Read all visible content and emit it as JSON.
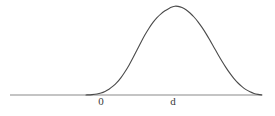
{
  "figure": {
    "kind": "bell-curve-plot",
    "background_color": "#ffffff",
    "curve_color": "#4a4a4a",
    "axis_color": "#8a8a8a",
    "label_color": "#3a3a3a"
  },
  "axis": {
    "name": "horizontal-axis",
    "x_start": 10,
    "x_end": 262,
    "y": 95,
    "stroke_width": 1.1
  },
  "labels": {
    "origin": "0",
    "mean": "d"
  },
  "chart_data": {
    "type": "line",
    "title": "",
    "subtitle": "",
    "xlabel": "",
    "ylabel": "",
    "grid": false,
    "legend": null,
    "annotations": [
      {
        "text": "0",
        "x": 101,
        "y": 106,
        "role": "x-tick-label"
      },
      {
        "text": "d",
        "x": 173,
        "y": 106,
        "role": "x-tick-label"
      }
    ],
    "axis_ranges": {
      "xlim": [
        10,
        262
      ],
      "ylim": [
        0,
        1
      ]
    },
    "series": [
      {
        "name": "gaussian-density",
        "shape": "bell",
        "peak_x": 175,
        "peak_y_px": 6,
        "baseline_y_px": 95,
        "left_foot_x": 99,
        "right_foot_x": 259,
        "points_px": [
          [
            86,
            95
          ],
          [
            92,
            94.6
          ],
          [
            97,
            94.0
          ],
          [
            101,
            93.0
          ],
          [
            105,
            91.4
          ],
          [
            109,
            89.2
          ],
          [
            113,
            86.2
          ],
          [
            117,
            82.4
          ],
          [
            121,
            77.6
          ],
          [
            125,
            71.8
          ],
          [
            129,
            65.2
          ],
          [
            133,
            57.8
          ],
          [
            137,
            50.0
          ],
          [
            141,
            42.2
          ],
          [
            145,
            34.8
          ],
          [
            149,
            28.2
          ],
          [
            153,
            22.4
          ],
          [
            157,
            17.6
          ],
          [
            161,
            13.8
          ],
          [
            165,
            10.8
          ],
          [
            169,
            8.4
          ],
          [
            172,
            7.0
          ],
          [
            175,
            6.2
          ],
          [
            178,
            6.4
          ],
          [
            182,
            7.6
          ],
          [
            186,
            9.8
          ],
          [
            190,
            13.0
          ],
          [
            194,
            17.0
          ],
          [
            198,
            21.8
          ],
          [
            202,
            27.4
          ],
          [
            206,
            33.6
          ],
          [
            210,
            40.4
          ],
          [
            214,
            47.4
          ],
          [
            218,
            54.4
          ],
          [
            222,
            61.2
          ],
          [
            226,
            67.6
          ],
          [
            230,
            73.4
          ],
          [
            234,
            78.6
          ],
          [
            238,
            83.0
          ],
          [
            242,
            86.6
          ],
          [
            246,
            89.6
          ],
          [
            250,
            91.8
          ],
          [
            254,
            93.4
          ],
          [
            258,
            94.4
          ],
          [
            262,
            95.0
          ]
        ]
      }
    ]
  }
}
